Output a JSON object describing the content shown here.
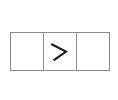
{
  "canvas": {
    "width": 118,
    "height": 100,
    "background_color": "#ffffff"
  },
  "widget": {
    "name": "three-cell-row",
    "description": "Horizontal three-cell box with a chevron in the middle cell",
    "border_color": "#8a8a8a",
    "fill_color": "#ffffff",
    "border_width_px": 1,
    "x": 10,
    "y": 32,
    "width": 100,
    "height": 39,
    "cells": [
      {
        "index": 0,
        "label": "",
        "icon": "",
        "content_type": "empty"
      },
      {
        "index": 1,
        "label": ">",
        "icon": "chevron-right-icon",
        "icon_color": "#1a1a1a",
        "content_type": "icon"
      },
      {
        "index": 2,
        "label": "",
        "icon": "",
        "content_type": "empty"
      }
    ]
  }
}
